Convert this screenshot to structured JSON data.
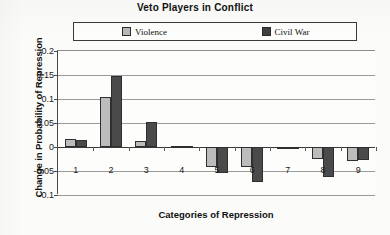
{
  "chart_data": {
    "type": "bar",
    "title": "Veto Players in Conflict",
    "xlabel": "Categories of Repression",
    "ylabel": "Change in Probability of Repression",
    "categories": [
      "1",
      "2",
      "3",
      "4",
      "5",
      "6",
      "7",
      "8",
      "9"
    ],
    "series": [
      {
        "name": "Violence",
        "color": "#bcbcbc",
        "values": [
          0.016,
          0.105,
          0.012,
          0.003,
          -0.042,
          -0.042,
          -0.003,
          -0.025,
          -0.03
        ]
      },
      {
        "name": "Civil War",
        "color": "#4a4a4a",
        "values": [
          0.014,
          0.148,
          0.052,
          0.002,
          -0.054,
          -0.072,
          -0.004,
          -0.062,
          -0.028
        ]
      }
    ],
    "ylim": [
      -0.1,
      0.2
    ],
    "yticks": [
      "0.2",
      "0.15",
      "0.1",
      "0.05",
      "0",
      "-0.05",
      "-0.1"
    ],
    "ytick_values": [
      0.2,
      0.15,
      0.1,
      0.05,
      0,
      -0.05,
      -0.1
    ],
    "grid": true,
    "legend_position": "top"
  },
  "legend": {
    "entries": [
      {
        "label": "Violence",
        "swatch": "light-gray-square-icon"
      },
      {
        "label": "Civil War",
        "swatch": "dark-gray-square-icon"
      }
    ]
  }
}
